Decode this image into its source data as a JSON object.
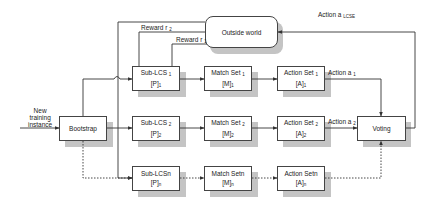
{
  "diagram": {
    "outside_world": {
      "label": "Outside world"
    },
    "input_label": {
      "line1": "New",
      "line2": "training",
      "line3": "instance"
    },
    "bootstrap": {
      "label": "Bootstrap"
    },
    "voting": {
      "label": "Voting"
    },
    "rows": [
      {
        "sub_lcs": {
          "name": "Sub-LCS",
          "sub": "1",
          "set": "[P]",
          "set_sub": "1"
        },
        "match_set": {
          "name": "Match Set",
          "sub": "1",
          "set": "[M]",
          "set_sub": "1"
        },
        "action_set": {
          "name": "Action Set",
          "sub": "1",
          "set": "[A]",
          "set_sub": "1"
        },
        "action_label": {
          "text": "Action a",
          "sub": "1"
        },
        "reward_label": {
          "text": "Reward r",
          "sub": "1"
        }
      },
      {
        "sub_lcs": {
          "name": "Sub-LCS",
          "sub": "2",
          "set": "[P]",
          "set_sub": "2"
        },
        "match_set": {
          "name": "Match Set",
          "sub": "2",
          "set": "[M]",
          "set_sub": "2"
        },
        "action_set": {
          "name": "Action Set",
          "sub": "2",
          "set": "[A]",
          "set_sub": "2"
        },
        "action_label": {
          "text": "Action a",
          "sub": "2"
        },
        "reward_label": {
          "text": "Reward r",
          "sub": "2"
        }
      },
      {
        "sub_lcs": {
          "name": "Sub-LCSn",
          "sub": "",
          "set": "[P]",
          "set_sub": "n"
        },
        "match_set": {
          "name": "Match Setn",
          "sub": "",
          "set": "[M]",
          "set_sub": "n"
        },
        "action_set": {
          "name": "Action Setn",
          "sub": "",
          "set": "[A]",
          "set_sub": "n"
        }
      }
    ],
    "final_action": {
      "text": "Action a",
      "sub": "LCSE"
    }
  }
}
